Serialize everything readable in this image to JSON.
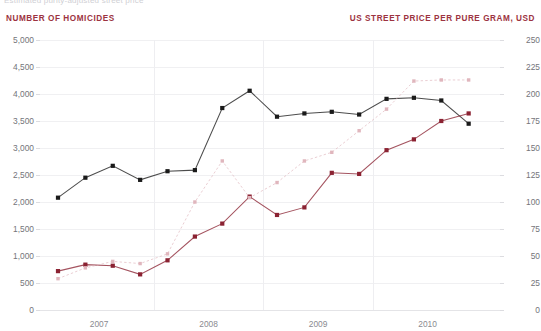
{
  "caption_partial": "Estimated purity-adjusted street price",
  "axis_titles": {
    "left": "NUMBER OF HOMICIDES",
    "right": "US STREET PRICE PER PURE GRAM, USD"
  },
  "colors": {
    "homicides": "#1a1a1a",
    "price_low": "#8B2232",
    "price_high": "#e0b6bd",
    "accent_label": "#9c3341",
    "grid": "#f0f0f2",
    "tick_text": "#74747a"
  },
  "chart_data": {
    "type": "line",
    "title": "",
    "xlabel": "",
    "ylabel": "NUMBER OF HOMICIDES",
    "y2label": "US STREET PRICE PER PURE GRAM, USD",
    "grid": true,
    "legend_position": "none",
    "x_tick_labels": [
      "2007",
      "2008",
      "2009",
      "2010"
    ],
    "x_tick_positions": [
      1.5,
      5.5,
      9.5,
      13.5
    ],
    "x_gridline_positions": [
      3.5,
      7.5,
      11.5
    ],
    "n_points": 16,
    "ylim": [
      0,
      5000
    ],
    "y_ticks": [
      "0",
      "500",
      "1,000",
      "1,500",
      "2,000",
      "2,500",
      "3,000",
      "3,500",
      "4,000",
      "4,500",
      "5,000"
    ],
    "y2lim": [
      0,
      250
    ],
    "y2_ticks": [
      "0",
      "25",
      "50",
      "75",
      "100",
      "125",
      "150",
      "175",
      "200",
      "225",
      "250"
    ],
    "series": [
      {
        "name": "Number of homicides",
        "axis": "left",
        "color": "#1a1a1a",
        "style": "solid",
        "values": [
          2080,
          2450,
          2670,
          2410,
          2570,
          2590,
          3740,
          4060,
          3580,
          3640,
          3670,
          3620,
          3910,
          3930,
          3880,
          3450
        ]
      },
      {
        "name": "US street price per pure gram, USD (lower estimate)",
        "axis": "right",
        "color": "#8B2232",
        "style": "solid",
        "values": [
          36,
          42,
          41,
          33,
          46,
          68,
          80,
          105,
          88,
          95,
          127,
          126,
          148,
          158,
          175,
          182
        ]
      },
      {
        "name": "US street price per pure gram, USD (upper estimate)",
        "axis": "right",
        "color": "#e0b6bd",
        "style": "dotted",
        "values": [
          29,
          39,
          45,
          43,
          52,
          100,
          138,
          104,
          118,
          138,
          146,
          166,
          186,
          212,
          213,
          213
        ]
      }
    ]
  }
}
